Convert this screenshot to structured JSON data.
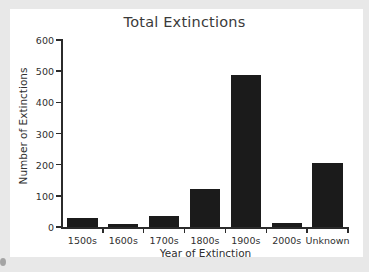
{
  "chart_data": {
    "type": "bar",
    "title": "Total Extinctions",
    "xlabel": "Year of Extinction",
    "ylabel": "Number of Extinctions",
    "categories": [
      "1500s",
      "1600s",
      "1700s",
      "1800s",
      "1900s",
      "2000s",
      "Unknown"
    ],
    "values": [
      29,
      9,
      34,
      122,
      489,
      13,
      204
    ],
    "ylim": [
      0,
      600
    ],
    "yticks": [
      0,
      100,
      200,
      300,
      400,
      500,
      600
    ],
    "ytick_labels": [
      "0",
      "100",
      "200",
      "300",
      "400",
      "500",
      "600"
    ],
    "grid": false,
    "legend": "none",
    "bar_color": "#1b1b1b",
    "axis_color": "#2b2b2b",
    "plot_background": "#ffffff",
    "figure_background": "#e8e8e8"
  }
}
